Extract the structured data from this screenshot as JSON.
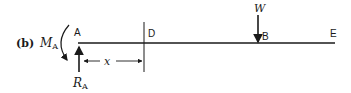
{
  "figure": {
    "panel_label": "(b)",
    "points": {
      "A": "A",
      "D": "D",
      "B": "B",
      "E": "E"
    },
    "moment": {
      "symbol": "M",
      "subscript": "A"
    },
    "reaction": {
      "symbol": "R",
      "subscript": "A"
    },
    "load": {
      "symbol": "W"
    },
    "dimension": {
      "symbol": "x"
    },
    "colors": {
      "ink": "#1a1a1a",
      "background": "#ffffff"
    }
  }
}
